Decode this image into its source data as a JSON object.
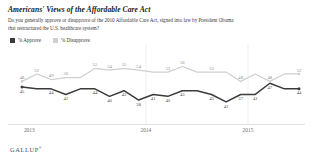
{
  "header": {
    "title": "Americans' Views of the Affordable Care Act",
    "subtitle": "Do you generally approve or disapprove of the 2010 Affordable Care Act, signed into law by President Obama that restructured the U.S. healthcare system?"
  },
  "legend": {
    "approve_label": "% Approve",
    "disapprove_label": "% Disapprove",
    "approve_color": "#3b3b3b",
    "disapprove_color": "#cfcfcf"
  },
  "footer": {
    "brand": "GALLUP",
    "trademark": "®"
  },
  "chart_data": {
    "type": "line",
    "title": "Americans' Views of the Affordable Care Act",
    "xlabel": "",
    "ylabel": "",
    "ylim": [
      30,
      60
    ],
    "grid": false,
    "legend_position": "top-left",
    "x_tick_labels": [
      "2013",
      "2014",
      "2015"
    ],
    "x_tick_positions": [
      0.5,
      8.5,
      15.5
    ],
    "categories": [
      "Nov 2013",
      "Jan 2014",
      "Feb 2014",
      "Apr 2014",
      "May 2014",
      "Jul 2014",
      "Aug 2014",
      "Sep 2014",
      "Oct 2014",
      "Nov 2014",
      "Dec 2014",
      "Jan 2015",
      "Feb 2015",
      "Apr 2015",
      "Jul 2015",
      "Sep 2015",
      "Nov 2015",
      "Jan 2016",
      "Apr 2016",
      "Nov 2016"
    ],
    "series": [
      {
        "name": "% Approve",
        "color": "#3b3b3b",
        "values": [
          45,
          44,
          44,
          41,
          44,
          44,
          40,
          43,
          38,
          41,
          40,
          43,
          43,
          41,
          37,
          41,
          41,
          47,
          44,
          44
        ]
      },
      {
        "name": "% Disapprove",
        "color": "#cfcfcf",
        "values": [
          48,
          52,
          49,
          50,
          50,
          55,
          54,
          55,
          54,
          53,
          53,
          56,
          53,
          53,
          53,
          48,
          52,
          48,
          52,
          52
        ]
      }
    ],
    "approve_point_labels": [
      "45",
      "",
      "44",
      "41",
      "",
      "44",
      "40",
      "43",
      "38",
      "41",
      "40",
      "43",
      "",
      "43",
      "41",
      "37",
      "41",
      "47",
      "",
      "44"
    ],
    "disapprove_point_labels": [
      "48",
      "52",
      "49",
      "50",
      "",
      "55",
      "54",
      "55",
      "54",
      "",
      "53",
      "56",
      "",
      "53",
      "",
      "48",
      "",
      "48",
      "",
      "52"
    ]
  }
}
